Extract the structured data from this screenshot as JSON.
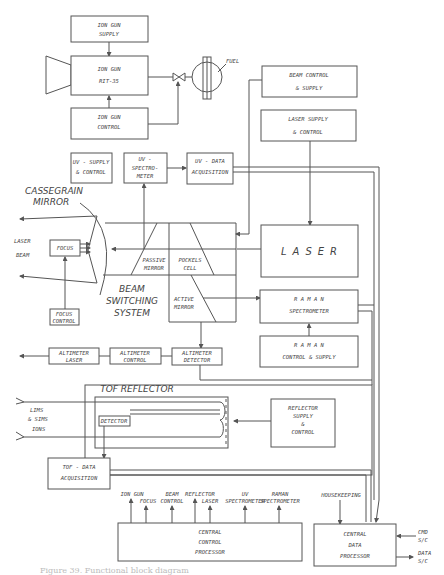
{
  "diagram": {
    "ion_gun_supply": [
      "ION GUN",
      "SUPPLY"
    ],
    "ion_gun": [
      "ION GUN",
      "RIT-35"
    ],
    "ion_gun_control": [
      "ION GUN",
      "CONTROL"
    ],
    "fuel": "FUEL",
    "beam_control_supply": [
      "BEAM CONTROL",
      "& SUPPLY"
    ],
    "laser_supply_control": [
      "LASER SUPPLY",
      "& CONTROL"
    ],
    "uv_supply_control": [
      "UV - SUPPLY",
      "& CONTROL"
    ],
    "uv_spectrometer": [
      "UV -",
      "SPECTRO-",
      "METER"
    ],
    "uv_data_acquisition": [
      "UV - DATA",
      "ACQUISITION"
    ],
    "cassegrain_mirror": [
      "CASSEGRAIN",
      "MIRROR"
    ],
    "laser_beam": [
      "LASER",
      "BEAM"
    ],
    "focus": "FOCUS",
    "focus_control": [
      "FOCUS",
      "CONTROL"
    ],
    "passive_mirror": [
      "PASSIVE",
      "MIRROR"
    ],
    "pockels_cell": [
      "POCKELS",
      "CELL"
    ],
    "active_mirror": [
      "ACTIVE",
      "MIRROR"
    ],
    "beam_switching_system": [
      "BEAM",
      "SWITCHING",
      "SYSTEM"
    ],
    "laser": "LASER",
    "raman_spectrometer": [
      "R A M A N",
      "SPECTROMETER"
    ],
    "raman_control_supply": [
      "R A M A N",
      "CONTROL & SUPPLY"
    ],
    "altimeter_laser": [
      "ALTIMETER",
      "LASER"
    ],
    "altimeter_control": [
      "ALTIMETER",
      "CONTROL"
    ],
    "altimeter_detector": [
      "ALTIMETER",
      "DETECTOR"
    ],
    "tof_reflector": "TOF REFLECTOR",
    "ions": [
      "LIMS",
      "& SIMS",
      "IONS"
    ],
    "detector": "DETECTOR",
    "reflector_supply_control": [
      "REFLECTOR",
      "SUPPLY",
      "&",
      "CONTROL"
    ],
    "tof_data_acquisition": [
      "TOF - DATA",
      "ACQUISITION"
    ],
    "ccp_inputs": {
      "ion_gun": "ION GUN",
      "focus": "FOCUS",
      "beam_control": [
        "BEAM",
        "CONTROL"
      ],
      "reflector": "REFLECTOR",
      "laser": "LASER",
      "uv_spectrometer": [
        "UV",
        "SPECTROMETER"
      ],
      "raman_spectrometer": [
        "RAMAN",
        "SPECTROMETER"
      ]
    },
    "central_control_processor": [
      "CENTRAL",
      "CONTROL",
      "PROCESSOR"
    ],
    "housekeeping": "HOUSEKEEPING",
    "central_data_processor": [
      "CENTRAL",
      "DATA",
      "PROCESSOR"
    ],
    "cmd_sc": [
      "CMD",
      "S/C"
    ],
    "data_sc": [
      "DATA",
      "S/C"
    ],
    "caption": "Figure 39. Functional block diagram"
  }
}
